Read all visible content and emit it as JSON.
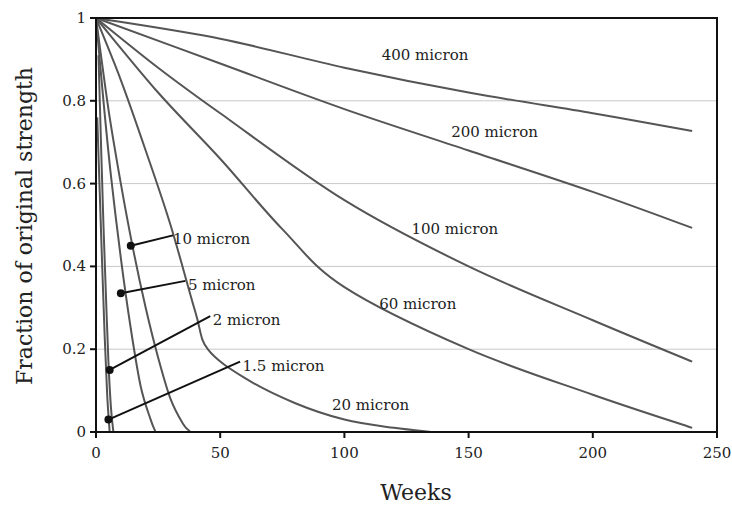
{
  "chart_data": {
    "type": "line",
    "title": "",
    "xlabel": "Weeks",
    "ylabel": "Fraction of original strength",
    "xlim": [
      0,
      250
    ],
    "ylim": [
      0,
      1
    ],
    "x_ticks": [
      0,
      50,
      100,
      150,
      200,
      250
    ],
    "x_tick_labels": [
      "0",
      "50",
      "100",
      "150",
      "200",
      "250"
    ],
    "y_ticks": [
      0,
      0.2,
      0.4,
      0.6,
      0.8,
      1
    ],
    "y_tick_labels": [
      "0",
      "0.2",
      "0.4",
      "0.6",
      "0.8",
      "1"
    ],
    "grid": "horizontal",
    "legend": "inline labels",
    "series": [
      {
        "name": "400 micron",
        "x": [
          0,
          50,
          100,
          150,
          200,
          240
        ],
        "y": [
          1.0,
          0.95,
          0.88,
          0.82,
          0.77,
          0.727
        ]
      },
      {
        "name": "200 micron",
        "x": [
          0,
          50,
          100,
          150,
          200,
          240
        ],
        "y": [
          1.0,
          0.89,
          0.78,
          0.68,
          0.58,
          0.493
        ]
      },
      {
        "name": "100 micron",
        "x": [
          0,
          25,
          50,
          100,
          150,
          200,
          240
        ],
        "y": [
          1.0,
          0.88,
          0.77,
          0.56,
          0.4,
          0.27,
          0.17
        ]
      },
      {
        "name": "60 micron",
        "x": [
          0,
          25,
          50,
          75,
          100,
          150,
          200,
          240
        ],
        "y": [
          1.0,
          0.82,
          0.66,
          0.49,
          0.35,
          0.2,
          0.09,
          0.01
        ]
      },
      {
        "name": "20 micron",
        "x": [
          0,
          10,
          20,
          30,
          40,
          45,
          60,
          80,
          100,
          120,
          135
        ],
        "y": [
          1.0,
          0.85,
          0.68,
          0.5,
          0.29,
          0.2,
          0.13,
          0.07,
          0.03,
          0.01,
          0.0
        ]
      },
      {
        "name": "10 micron",
        "x": [
          0,
          5,
          10,
          15,
          20,
          25,
          30,
          35,
          38
        ],
        "y": [
          1.0,
          0.78,
          0.6,
          0.44,
          0.3,
          0.18,
          0.08,
          0.02,
          0.0
        ]
      },
      {
        "name": "5 micron",
        "x": [
          0,
          3,
          6,
          10,
          14,
          18,
          22,
          24
        ],
        "y": [
          1.0,
          0.8,
          0.62,
          0.42,
          0.25,
          0.11,
          0.03,
          0.0
        ]
      },
      {
        "name": "2 micron",
        "x": [
          1,
          2,
          3,
          4,
          5,
          6,
          7
        ],
        "y": [
          0.91,
          0.7,
          0.5,
          0.33,
          0.17,
          0.06,
          0.0
        ]
      },
      {
        "name": "1.5 micron",
        "x": [
          0.5,
          1.5,
          2.5,
          3.5,
          4.5,
          5.5
        ],
        "y": [
          0.76,
          0.58,
          0.4,
          0.23,
          0.09,
          0.0
        ]
      }
    ],
    "labels": [
      {
        "text": "400 micron",
        "x": 115,
        "y": 0.91
      },
      {
        "text": "200 micron",
        "x": 143,
        "y": 0.725
      },
      {
        "text": "100 micron",
        "x": 127,
        "y": 0.49
      },
      {
        "text": "60 micron",
        "x": 114,
        "y": 0.31
      },
      {
        "text": "20 micron",
        "x": 95,
        "y": 0.065
      },
      {
        "text": "10 micron",
        "x": 31,
        "y": 0.465
      },
      {
        "text": "5 micron",
        "x": 37,
        "y": 0.355
      },
      {
        "text": "2 micron",
        "x": 47,
        "y": 0.27
      },
      {
        "text": "1.5 micron",
        "x": 59,
        "y": 0.16
      }
    ],
    "leaders": [
      {
        "label": "10 micron",
        "from": [
          14,
          0.45
        ],
        "to": [
          31,
          0.475
        ]
      },
      {
        "label": "5 micron",
        "from": [
          10,
          0.335
        ],
        "to": [
          36,
          0.365
        ]
      },
      {
        "label": "2 micron",
        "from": [
          5.5,
          0.15
        ],
        "to": [
          46,
          0.28
        ]
      },
      {
        "label": "1.5 micron",
        "from": [
          5,
          0.03
        ],
        "to": [
          58,
          0.17
        ]
      }
    ]
  }
}
